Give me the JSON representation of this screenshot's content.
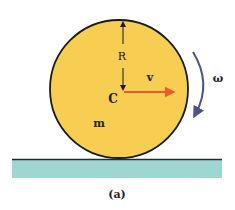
{
  "diagram": {
    "caption": "(a)",
    "labels": {
      "radius": "R",
      "velocity": "v",
      "center": "C",
      "mass": "m",
      "angular_velocity": "ω"
    },
    "colors": {
      "disk_fill": "#f7cd52",
      "disk_stroke": "#1a1a1a",
      "ground_fill": "#9fd6d2",
      "ground_line": "#2a2a2a",
      "velocity_arrow": "#ef5a2c",
      "omega_arrow": "#4a5287",
      "text": "#222222"
    }
  }
}
